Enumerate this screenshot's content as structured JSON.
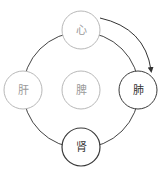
{
  "diagram": {
    "title": "",
    "nodes": [
      {
        "id": "heart",
        "label": "心",
        "position": "top",
        "style": "light"
      },
      {
        "id": "liver",
        "label": "肝",
        "position": "left",
        "style": "light"
      },
      {
        "id": "spleen",
        "label": "脾",
        "position": "center",
        "style": "light"
      },
      {
        "id": "lung",
        "label": "肺",
        "position": "right",
        "style": "dark"
      },
      {
        "id": "kidney",
        "label": "肾",
        "position": "bottom",
        "style": "dark"
      }
    ],
    "edges": [
      {
        "from": "heart",
        "to": "lung",
        "type": "arrow"
      }
    ],
    "colors": {
      "light_stroke": "#b8b8b8",
      "light_text": "#9a9a9a",
      "dark_stroke": "#3a3a3a",
      "dark_text": "#333333",
      "ring": "#444444"
    }
  }
}
